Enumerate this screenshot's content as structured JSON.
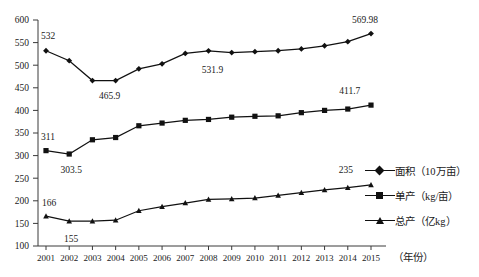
{
  "chart_data": {
    "type": "line",
    "title": "",
    "xlabel": "（年份）",
    "ylabel": "",
    "ylim": [
      100,
      600
    ],
    "ytick_step": 50,
    "grid": false,
    "legend_position": "right",
    "categories": [
      "2001",
      "2002",
      "2003",
      "2004",
      "2005",
      "2006",
      "2007",
      "2008",
      "2009",
      "2010",
      "2011",
      "2012",
      "2013",
      "2014",
      "2015"
    ],
    "yticks": [
      "100",
      "150",
      "200",
      "250",
      "300",
      "350",
      "400",
      "450",
      "500",
      "550",
      "600"
    ],
    "series": [
      {
        "name": "面积（10万亩）",
        "marker": "diamond",
        "values": [
          532,
          510,
          466,
          465.9,
          492,
          503,
          526,
          531.9,
          528,
          530,
          532,
          536,
          543,
          552,
          569.98
        ]
      },
      {
        "name": "单产（kg/亩）",
        "marker": "square",
        "values": [
          311,
          303.5,
          335,
          340,
          366,
          372,
          378,
          380,
          385,
          387,
          388,
          395,
          400,
          403,
          411.7
        ]
      },
      {
        "name": "总产（亿kg）",
        "marker": "triangle",
        "values": [
          166,
          155,
          155,
          157,
          178,
          187,
          195,
          203,
          204,
          206,
          212,
          218,
          224,
          229,
          235
        ]
      }
    ],
    "annotations": [
      {
        "text": "532",
        "x_index": 0,
        "value": 532,
        "dx": 2,
        "dy": -12
      },
      {
        "text": "465.9",
        "x_index": 3,
        "value": 465.9,
        "dx": -6,
        "dy": 18
      },
      {
        "text": "531.9",
        "x_index": 7,
        "value": 531.9,
        "dx": 4,
        "dy": 22
      },
      {
        "text": "569.98",
        "x_index": 14,
        "value": 569.98,
        "dx": -6,
        "dy": -11
      },
      {
        "text": "311",
        "x_index": 0,
        "value": 311,
        "dx": 2,
        "dy": -11
      },
      {
        "text": "303.5",
        "x_index": 1,
        "value": 303.5,
        "dx": 2,
        "dy": 19
      },
      {
        "text": "411.7",
        "x_index": 13,
        "value": 411.7,
        "dx": 2,
        "dy": -11
      },
      {
        "text": "166",
        "x_index": 0,
        "value": 166,
        "dx": 3,
        "dy": -10
      },
      {
        "text": "155",
        "x_index": 1,
        "value": 155,
        "dx": 2,
        "dy": 21
      },
      {
        "text": "235",
        "x_index": 13,
        "value": 235,
        "dx": -2,
        "dy": -12
      }
    ]
  },
  "legend": {
    "items": [
      {
        "label": "面积（10万亩）",
        "marker": "diamond"
      },
      {
        "label": "单产（kg/亩）",
        "marker": "square"
      },
      {
        "label": "总产（亿kg）",
        "marker": "triangle"
      }
    ]
  },
  "axis": {
    "x_caption": "（年份）"
  },
  "colors": {
    "line": "#111111",
    "axis": "#3a3a3a",
    "text": "#1a1a1a",
    "background": "#ffffff"
  }
}
